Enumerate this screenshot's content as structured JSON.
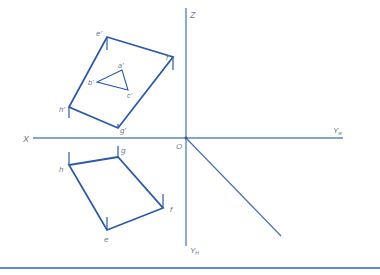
{
  "colors": {
    "axis": "#5b86c2",
    "shape": "#2c5aa8",
    "label": "#6b7a8c",
    "rule": "#5b8fcf"
  },
  "axes": {
    "x_label": "X",
    "z_label": "Z",
    "origin_label": "O",
    "yw_label": "Y",
    "yw_sub": "w",
    "yh_label": "Y",
    "yh_sub": "H"
  },
  "front_view": {
    "vertices": {
      "e": "e'",
      "f": "f'",
      "g": "g'",
      "h": "h'"
    },
    "triangle": {
      "a": "a'",
      "b": "b'",
      "c": "c'"
    }
  },
  "top_view": {
    "vertices": {
      "e": "e",
      "f": "f",
      "g": "g",
      "h": "h"
    }
  }
}
